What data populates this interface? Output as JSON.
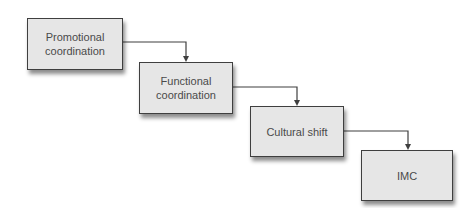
{
  "diagram": {
    "type": "staircase-flow",
    "nodes": [
      {
        "id": "n1",
        "label": "Promotional\ncoordination"
      },
      {
        "id": "n2",
        "label": "Functional\ncoordination"
      },
      {
        "id": "n3",
        "label": "Cultural shift"
      },
      {
        "id": "n4",
        "label": "IMC"
      }
    ],
    "edges": [
      {
        "from": "n1",
        "to": "n2"
      },
      {
        "from": "n2",
        "to": "n3"
      },
      {
        "from": "n3",
        "to": "n4"
      }
    ],
    "colors": {
      "box_fill": "#e6e6e6",
      "box_border": "#3f3f3f",
      "text": "#4a4a4a",
      "connector": "#3f3f3f",
      "background": "#ffffff"
    }
  }
}
